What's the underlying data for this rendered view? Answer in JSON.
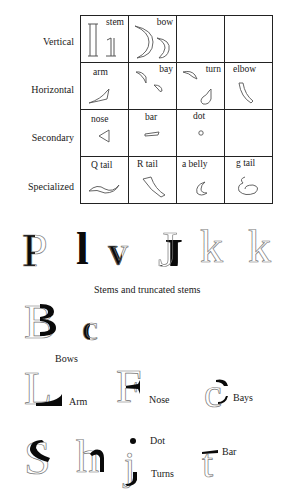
{
  "table": {
    "row_labels": [
      "Vertical",
      "Horizontal",
      "Secondary",
      "Specialized"
    ],
    "cells": [
      [
        "stem",
        "bow",
        "",
        ""
      ],
      [
        "arm",
        "bay",
        "turn",
        "elbow"
      ],
      [
        "nose",
        "bar",
        "dot",
        ""
      ],
      [
        "Q tail",
        "R tail",
        "a belly",
        "g tail"
      ]
    ]
  },
  "stems_row": {
    "letters": [
      "P",
      "l",
      "v",
      "J",
      "k",
      "k"
    ],
    "caption": "Stems and truncated stems"
  },
  "bows_row": {
    "letters": [
      "B",
      "c"
    ],
    "caption": "Bows"
  },
  "arm_row": {
    "items": [
      {
        "letter": "L",
        "caption": "Arm"
      },
      {
        "letter": "F",
        "caption": "Nose"
      },
      {
        "letter": "c",
        "caption": "Bays"
      }
    ]
  },
  "last_row": {
    "letters": [
      "S",
      "h",
      "j",
      "t"
    ],
    "captions": {
      "dot": "Dot",
      "turns": "Turns",
      "bar": "Bar"
    }
  }
}
